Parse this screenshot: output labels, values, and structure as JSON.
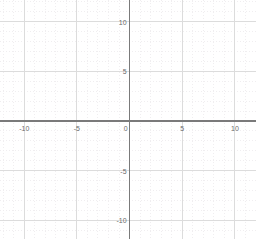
{
  "chart_data": {
    "type": "scatter",
    "title": "",
    "subtitle": "",
    "xlabel": "",
    "ylabel": "",
    "series": [
      {
        "name": "empty",
        "x": [],
        "y": []
      }
    ],
    "xlim": [
      -12.3,
      12.0
    ],
    "ylim": [
      -11.9,
      12.2
    ],
    "x_ticks": [
      -10,
      -5,
      0,
      5,
      10
    ],
    "y_ticks": [
      10,
      5,
      0,
      -5,
      -10
    ],
    "x_tick_labels": [
      "-10",
      "-5",
      "0",
      "5",
      "10"
    ],
    "y_tick_labels": [
      "10",
      "5",
      "0",
      "-5",
      "-10"
    ],
    "major_grid_step": 5,
    "minor_grid_step": 1,
    "grid": true,
    "minor_grid": true,
    "legend": false,
    "legend_position": "none",
    "annotations": [],
    "data_labels": []
  },
  "plot": {
    "background_color": "#ffffff",
    "axis_color": "#7a7a7a",
    "major_grid_color": "#dcdcdc",
    "minor_grid_color": "#f0eef0",
    "tick_label_color": "#6b6b6b",
    "origin_label": "0"
  },
  "x_axis": {
    "name": "x-axis",
    "ticks": [
      {
        "value": -10,
        "label": "-10"
      },
      {
        "value": -5,
        "label": "-5"
      },
      {
        "value": 0,
        "label": "0"
      },
      {
        "value": 5,
        "label": "5"
      },
      {
        "value": 10,
        "label": "10"
      }
    ]
  },
  "y_axis": {
    "name": "y-axis",
    "ticks": [
      {
        "value": 10,
        "label": "10"
      },
      {
        "value": 5,
        "label": "5"
      },
      {
        "value": -5,
        "label": "-5"
      },
      {
        "value": -10,
        "label": "-10"
      }
    ]
  }
}
